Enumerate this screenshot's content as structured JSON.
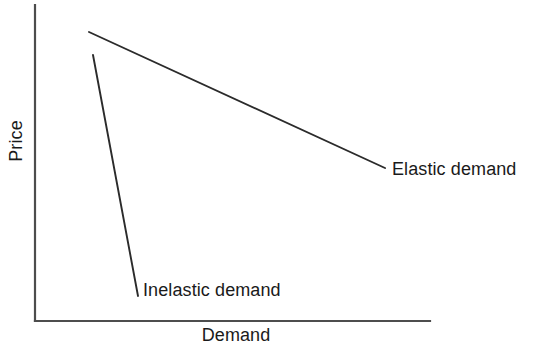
{
  "chart_data": {
    "type": "line",
    "title": "",
    "subtitle": "",
    "xlabel": "Demand",
    "ylabel": "Price",
    "grid": false,
    "legend_position": "inline-end-of-line",
    "axis_style": "two-sided open axes, no tick marks, no numeric scale",
    "xlim": [
      0,
      1
    ],
    "ylim": [
      0,
      1
    ],
    "annotations": [
      "Elastic demand",
      "Inelastic demand"
    ],
    "series": [
      {
        "name": "Elastic demand",
        "label": "Elastic demand",
        "description": "shallow downward-sloping demand curve",
        "color": "#2b2b2b",
        "points_px": [
          {
            "x": 89,
            "y": 32
          },
          {
            "x": 385,
            "y": 168
          }
        ],
        "x": [
          0.137,
          0.886
        ],
        "values": [
          0.91,
          0.484
        ],
        "label_anchor_px": {
          "x": 392,
          "y": 169
        }
      },
      {
        "name": "Inelastic demand",
        "label": "Inelastic demand",
        "description": "steep downward-sloping demand curve",
        "color": "#2b2b2b",
        "points_px": [
          {
            "x": 93,
            "y": 55
          },
          {
            "x": 138,
            "y": 296
          }
        ],
        "x": [
          0.147,
          0.261
        ],
        "values": [
          0.838,
          0.078
        ],
        "label_anchor_px": {
          "x": 143,
          "y": 290
        }
      }
    ]
  },
  "axes": {
    "y_axis": {
      "label": "Price",
      "icon": "vertical-axis-line",
      "from_px": {
        "x": 35,
        "y": 5
      },
      "to_px": {
        "x": 35,
        "y": 321
      }
    },
    "x_axis": {
      "label": "Demand",
      "icon": "horizontal-axis-line",
      "from_px": {
        "x": 35,
        "y": 321
      },
      "to_px": {
        "x": 430,
        "y": 321
      }
    },
    "axis_color": "#4d4d4d"
  },
  "colors": {
    "background": "#ffffff",
    "axis": "#4d4d4d",
    "curve": "#2b2b2b",
    "text": "#1a1a1a"
  },
  "canvas": {
    "width": 533,
    "height": 347
  }
}
